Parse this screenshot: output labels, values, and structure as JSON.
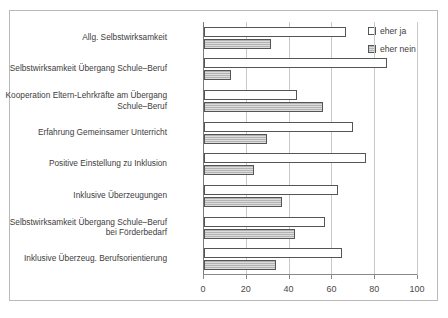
{
  "title_remnant": "",
  "legend": {
    "position": "top-right",
    "entries": [
      {
        "label": "eher ja",
        "key": "ja"
      },
      {
        "label": "eher nein",
        "key": "nein"
      }
    ]
  },
  "axis": {
    "ticks": [
      "0",
      "20",
      "40",
      "60",
      "80",
      "100"
    ]
  },
  "chart_data": {
    "type": "bar",
    "orientation": "horizontal",
    "title": "",
    "subtitle": "",
    "xlabel": "",
    "ylabel": "",
    "xlim": [
      0,
      100
    ],
    "xticks": [
      0,
      20,
      40,
      60,
      80,
      100
    ],
    "grid": true,
    "legend_position": "top-right",
    "categories": [
      "Allg. Selbstwirksamkeit",
      "Selbstwirksamkeit Übergang Schule–Beruf",
      "Kooperation Eltern-Lehrkräfte am Übergang\nSchule–Beruf",
      "Erfahrung Gemeinsamer Unterricht",
      "Positive Einstellung zu Inklusion",
      "Inklusive Überzeugungen",
      "Selbstwirksamkeit Übergang Schule–Beruf\nbei Förderbedarf",
      "Inklusive Überzeug. Berufsorientierung"
    ],
    "series": [
      {
        "name": "eher ja",
        "values": [
          67,
          86,
          44,
          70,
          76,
          63,
          57,
          65
        ]
      },
      {
        "name": "eher nein",
        "values": [
          32,
          13,
          56,
          30,
          24,
          37,
          43,
          34
        ]
      }
    ]
  }
}
